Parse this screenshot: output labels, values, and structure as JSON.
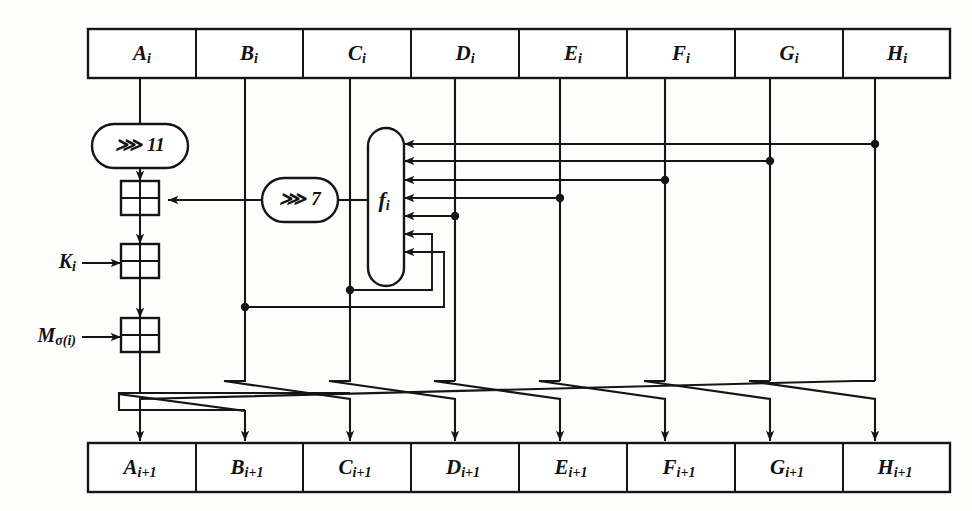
{
  "diagram": {
    "colors": {
      "ink": "#151515",
      "paper": "#fdfdfb",
      "fill": "#ffffff"
    },
    "input_row": {
      "name": "state-input-row",
      "cells": [
        {
          "base": "A",
          "sub": "i"
        },
        {
          "base": "B",
          "sub": "i"
        },
        {
          "base": "C",
          "sub": "i"
        },
        {
          "base": "D",
          "sub": "i"
        },
        {
          "base": "E",
          "sub": "i"
        },
        {
          "base": "F",
          "sub": "i"
        },
        {
          "base": "G",
          "sub": "i"
        },
        {
          "base": "H",
          "sub": "i"
        }
      ]
    },
    "output_row": {
      "name": "state-output-row",
      "cells": [
        {
          "base": "A",
          "sub": "i+1"
        },
        {
          "base": "B",
          "sub": "i+1"
        },
        {
          "base": "C",
          "sub": "i+1"
        },
        {
          "base": "D",
          "sub": "i+1"
        },
        {
          "base": "E",
          "sub": "i+1"
        },
        {
          "base": "F",
          "sub": "i+1"
        },
        {
          "base": "G",
          "sub": "i+1"
        },
        {
          "base": "H",
          "sub": "i+1"
        }
      ]
    },
    "rotations": [
      {
        "name": "rotate-11",
        "label": "⋙ 11",
        "symbol": "⋙",
        "amount": "11"
      },
      {
        "name": "rotate-7",
        "label": "⋙ 7",
        "symbol": "⋙",
        "amount": "7"
      }
    ],
    "function_block": {
      "name": "f-function",
      "base": "f",
      "sub": "i",
      "input_count": 7
    },
    "xor_gates": [
      {
        "name": "xor-rotation-f"
      },
      {
        "name": "xor-key"
      },
      {
        "name": "xor-message"
      }
    ],
    "side_inputs": [
      {
        "name": "round-key-input",
        "base": "K",
        "sub": "i"
      },
      {
        "name": "message-word-input",
        "base": "M",
        "sub": "σ(i)"
      }
    ]
  }
}
